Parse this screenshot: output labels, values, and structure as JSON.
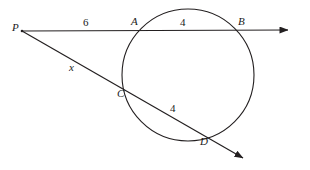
{
  "figure": {
    "type": "geometry-diagram",
    "background_color": "#ffffff",
    "stroke_color": "#231f20",
    "width": 310,
    "height": 170
  },
  "points": {
    "p": {
      "label": "P",
      "x": 22,
      "y": 31,
      "label_x": 12,
      "label_y": 22
    },
    "a": {
      "label": "A",
      "x": 142,
      "y": 30,
      "label_x": 131,
      "label_y": 16
    },
    "b": {
      "label": "B",
      "x": 236,
      "y": 30,
      "label_x": 238,
      "label_y": 16
    },
    "c": {
      "label": "C",
      "x": 129,
      "y": 94,
      "label_x": 117,
      "label_y": 88
    },
    "d": {
      "label": "D",
      "x": 204,
      "y": 134,
      "label_x": 200,
      "label_y": 136
    }
  },
  "circle": {
    "center_x": 188,
    "center_y": 75,
    "radius": 66
  },
  "segments": {
    "pa": {
      "measure": "6",
      "label_x": 83,
      "label_y": 17
    },
    "ab": {
      "measure": "4",
      "label_x": 180,
      "label_y": 17
    },
    "pc": {
      "measure": "x",
      "label_x": 69,
      "label_y": 62
    },
    "cd": {
      "measure": "4",
      "label_x": 170,
      "label_y": 103
    }
  },
  "rays": {
    "top_secant": {
      "from_x": 22,
      "from_y": 31,
      "to_x": 293,
      "to_y": 30,
      "arrow": "arrowhead-right"
    },
    "lower_secant": {
      "from_x": 22,
      "from_y": 31,
      "to_x": 248,
      "to_y": 161,
      "arrow": "arrowhead-down-right"
    }
  }
}
